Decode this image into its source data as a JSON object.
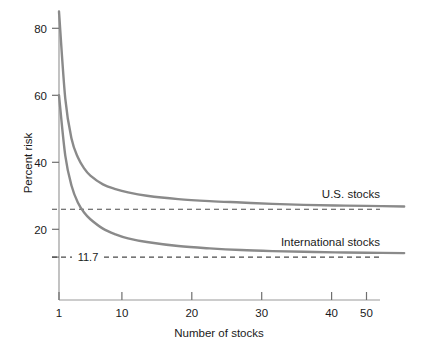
{
  "chart_data": {
    "type": "line",
    "title": "",
    "subtitle": "",
    "xlabel": "Number of stocks",
    "ylabel": "Percent risk",
    "xlim": [
      1,
      56
    ],
    "ylim": [
      6,
      86
    ],
    "xticks": [
      1,
      10,
      20,
      30,
      40,
      50
    ],
    "xticklabels": [
      "1",
      "10",
      "20",
      "30",
      "40",
      "50"
    ],
    "yticks": [
      20,
      40,
      60,
      80
    ],
    "yticklabels": [
      "20",
      "40",
      "60",
      "80"
    ],
    "grid": false,
    "legend_position": "inline-right",
    "series": [
      {
        "name": "U.S. stocks",
        "label": "U.S. stocks",
        "color": "#8a8a8a",
        "asymptote": 26.0,
        "x": [
          1,
          2,
          3,
          4,
          5,
          6,
          8,
          10,
          12,
          15,
          20,
          25,
          30,
          35,
          40,
          45,
          50,
          56
        ],
        "values": [
          85.0,
          59.0,
          47.0,
          41.5,
          38.2,
          36.0,
          33.4,
          32.0,
          31.0,
          30.0,
          29.0,
          28.4,
          28.0,
          27.6,
          27.3,
          27.1,
          27.0,
          26.8
        ]
      },
      {
        "name": "International stocks",
        "label": "International stocks",
        "color": "#8a8a8a",
        "asymptote": 11.7,
        "x": [
          1,
          2,
          3,
          4,
          5,
          6,
          8,
          10,
          12,
          15,
          20,
          25,
          30,
          35,
          40,
          45,
          50,
          56
        ],
        "values": [
          60.0,
          42.0,
          33.0,
          28.0,
          25.0,
          23.0,
          20.2,
          18.5,
          17.3,
          16.2,
          15.0,
          14.3,
          13.8,
          13.5,
          13.3,
          13.1,
          13.0,
          12.9
        ]
      }
    ],
    "reference_lines": [
      {
        "name": "us-asymptote",
        "value": 26.0,
        "label": "",
        "style": "dashed",
        "color": "#4a4a4a"
      },
      {
        "name": "international-asymptote",
        "value": 11.7,
        "label": "11.7",
        "style": "dashed",
        "color": "#4a4a4a"
      }
    ],
    "annotations": [
      {
        "name": "value-11-7",
        "text": "11.7",
        "x": 4.2,
        "y": 11.7
      }
    ],
    "colors": {
      "curve": "#8a8a8a",
      "axis": "#9a9a9a",
      "dashed": "#4a4a4a",
      "text": "#1a1a1a",
      "background": "#ffffff"
    }
  }
}
